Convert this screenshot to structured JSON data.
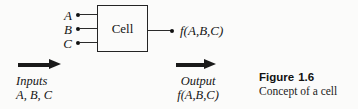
{
  "figure": {
    "background_color": "#fbfbfa",
    "ink_color": "#1a1a1a",
    "block": {
      "label": "Cell"
    },
    "inputs": {
      "signals": [
        {
          "label": "A"
        },
        {
          "label": "B"
        },
        {
          "label": "C"
        }
      ],
      "flow_label": "Inputs",
      "flow_values": "A, B, C",
      "arrow": "right-arrow-icon"
    },
    "output": {
      "expression": "f(A,B,C)",
      "flow_label": "Output",
      "flow_values": "f(A,B,C)",
      "arrow": "right-arrow-icon"
    },
    "caption": {
      "label": "Figure",
      "number": "1.6",
      "description": "Concept of a cell"
    }
  },
  "chart_data": {
    "type": "diagram",
    "nodes": [
      {
        "id": "cell",
        "label": "Cell",
        "shape": "rectangle"
      }
    ],
    "inputs": [
      "A",
      "B",
      "C"
    ],
    "outputs": [
      "f(A,B,C)"
    ],
    "edges": [
      {
        "from": "A",
        "to": "cell"
      },
      {
        "from": "B",
        "to": "cell"
      },
      {
        "from": "C",
        "to": "cell"
      },
      {
        "from": "cell",
        "to": "f(A,B,C)"
      }
    ],
    "annotations": [
      "Inputs",
      "A, B, C",
      "Output",
      "f(A,B,C)"
    ]
  }
}
